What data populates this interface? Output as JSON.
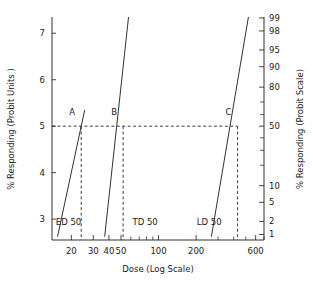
{
  "chart_data": {
    "type": "line",
    "title": "",
    "xlabel": "Dose (Log Scale)",
    "ylabel": "% Responding  (Probit Units )",
    "y2label": "% Responding (Probit Scale)",
    "xscale": "log",
    "xlim": [
      14,
      700
    ],
    "ylim": [
      2.55,
      7.35
    ],
    "grid": false,
    "legend": "none",
    "x_ticks": [
      {
        "value": 20,
        "label": "20"
      },
      {
        "value": 30,
        "label": "30"
      },
      {
        "value": 40,
        "label": "40"
      },
      {
        "value": 50,
        "label": "50"
      },
      {
        "value": 100,
        "label": "100"
      },
      {
        "value": 200,
        "label": "200"
      },
      {
        "value": 600,
        "label": "600"
      }
    ],
    "x_minor_ticks": [
      60,
      70,
      80,
      90,
      300,
      400,
      500,
      700
    ],
    "y_ticks": [
      {
        "value": 7,
        "label": "7"
      },
      {
        "value": 6,
        "label": "6"
      },
      {
        "value": 5,
        "label": "5"
      },
      {
        "value": 4,
        "label": "4"
      },
      {
        "value": 3,
        "label": "3"
      }
    ],
    "y2_ticks": [
      {
        "probit": 7.33,
        "label": "99"
      },
      {
        "probit": 7.05,
        "label": "98"
      },
      {
        "probit": 6.64,
        "label": "95"
      },
      {
        "probit": 6.28,
        "label": "90"
      },
      {
        "probit": 5.84,
        "label": "80"
      },
      {
        "probit": 5.52,
        "label": ""
      },
      {
        "probit": 5.25,
        "label": ""
      },
      {
        "probit": 5.0,
        "label": "50"
      },
      {
        "probit": 4.75,
        "label": ""
      },
      {
        "probit": 4.48,
        "label": ""
      },
      {
        "probit": 4.16,
        "label": ""
      },
      {
        "probit": 3.72,
        "label": "10"
      },
      {
        "probit": 3.36,
        "label": "5"
      },
      {
        "probit": 2.95,
        "label": "2"
      },
      {
        "probit": 2.67,
        "label": "1"
      }
    ],
    "series": [
      {
        "name": "A",
        "annotation": "ED 50",
        "ed50_dose": 24,
        "points": [
          [
            15.5,
            2.62
          ],
          [
            25.6,
            5.35
          ]
        ]
      },
      {
        "name": "B",
        "annotation": "TD 50",
        "ed50_dose": 52,
        "points": [
          [
            37.0,
            2.62
          ],
          [
            57.5,
            7.35
          ]
        ]
      },
      {
        "name": "C",
        "annotation": "LD 50",
        "ed50_dose": 430,
        "points": [
          [
            265.0,
            2.62
          ],
          [
            525.0,
            7.35
          ]
        ]
      }
    ],
    "reference_lines": {
      "horizontal_probit": 5,
      "vertical_doses": [
        24,
        52,
        430
      ]
    },
    "point_labels": [
      {
        "text": "A",
        "dose": 24,
        "probit": 5
      },
      {
        "text": "B",
        "dose": 52,
        "probit": 5
      },
      {
        "text": "C",
        "dose": 430,
        "probit": 5
      }
    ],
    "annotations": [
      {
        "text": "ED 50",
        "dose": 19.0,
        "probit": 2.88
      },
      {
        "text": "TD 50",
        "dose": 78.0,
        "probit": 2.88
      },
      {
        "text": "LD 50",
        "dose": 255.0,
        "probit": 2.88
      }
    ]
  }
}
